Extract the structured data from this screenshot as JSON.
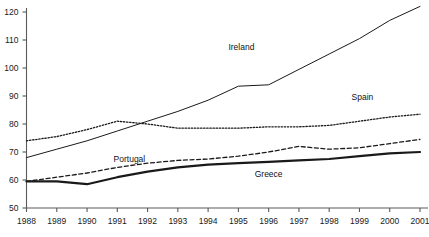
{
  "chart_data": {
    "type": "line",
    "title": "",
    "subtitle": "",
    "xlabel": "",
    "ylabel": "",
    "x": [
      1988,
      1989,
      1990,
      1991,
      1992,
      1993,
      1994,
      1995,
      1996,
      1997,
      1998,
      1999,
      2000,
      2001
    ],
    "categories": [
      "1988",
      "1989",
      "1990",
      "1991",
      "1992",
      "1993",
      "1994",
      "1995",
      "1996",
      "1997",
      "1998",
      "1999",
      "2000",
      "2001"
    ],
    "xlim": [
      1988,
      2001
    ],
    "ylim": [
      50,
      120
    ],
    "yticks": [
      50,
      60,
      70,
      80,
      90,
      100,
      110,
      120
    ],
    "ytick_labels": [
      "50",
      "60",
      "70",
      "80",
      "90",
      "100",
      "110",
      "120"
    ],
    "grid": false,
    "legend": "inline-annotations",
    "series": [
      {
        "name": "Ireland",
        "style": "solid-thin",
        "color": "#1a1a1a",
        "values": [
          68.0,
          71.0,
          74.0,
          77.5,
          81.0,
          84.5,
          88.5,
          93.5,
          94.0,
          99.5,
          105.0,
          110.5,
          117.0,
          122.0
        ],
        "label_x": 1995.1,
        "label_y": 107.5
      },
      {
        "name": "Spain",
        "style": "dotted",
        "color": "#1a1a1a",
        "values": [
          74.0,
          75.5,
          78.0,
          81.0,
          80.0,
          78.5,
          78.5,
          78.5,
          79.0,
          79.0,
          79.5,
          81.0,
          82.5,
          83.5
        ],
        "label_x": 1999.1,
        "label_y": 89.5
      },
      {
        "name": "Portugal",
        "style": "dashed",
        "color": "#1a1a1a",
        "values": [
          59.5,
          61.0,
          62.5,
          64.5,
          66.0,
          67.0,
          67.5,
          68.5,
          70.0,
          72.0,
          71.0,
          71.5,
          73.0,
          74.5
        ],
        "label_x": 1991.4,
        "label_y": 67.5
      },
      {
        "name": "Greece",
        "style": "solid-thick",
        "color": "#1a1a1a",
        "values": [
          59.5,
          59.5,
          58.5,
          61.0,
          63.0,
          64.5,
          65.5,
          66.0,
          66.5,
          67.0,
          67.5,
          68.5,
          69.5,
          70.0
        ],
        "label_x": 1996.0,
        "label_y": 62.0
      }
    ]
  },
  "axes": {
    "y_axis_name": "value-axis",
    "x_axis_name": "year-axis"
  }
}
